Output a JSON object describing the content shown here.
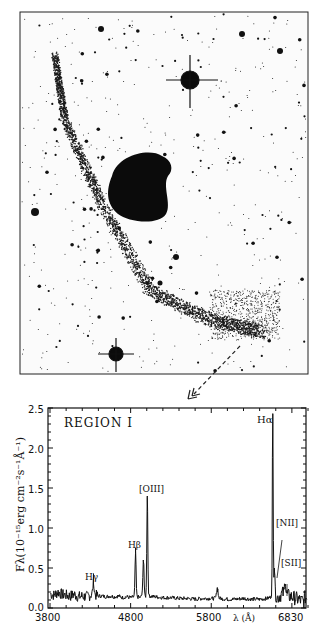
{
  "figure": {
    "image_panel": {
      "description": "Negative-print sky image of a galaxy with a curved tidal tail and bright foreground stars",
      "arrow": "dashed arrow from tail region pointing down to spectrum"
    },
    "spectrum_panel": {
      "region_label": "REGION I",
      "y_axis_label": "Fλ(10⁻¹⁵erg cm⁻²s⁻¹Å⁻¹)",
      "x_axis_label": "λ (Å)",
      "y_ticks": [
        "0.0",
        "0.5",
        "1.0",
        "1.5",
        "2.0",
        "2.5"
      ],
      "x_ticks": [
        "3800",
        "4800",
        "5800",
        "6830"
      ],
      "line_labels": {
        "hgamma": "Hγ",
        "hbeta": "Hβ",
        "oiii": "[OIII]",
        "halpha": "Hα",
        "nii": "[NII]",
        "sii": "[SII]"
      }
    }
  },
  "chart_data": {
    "type": "line",
    "title": "REGION I",
    "xlabel": "λ (Å)",
    "ylabel": "Fλ (10^-15 erg cm^-2 s^-1 Å^-1)",
    "xlim": [
      3800,
      7000
    ],
    "ylim": [
      0.0,
      2.5
    ],
    "x_ticks": [
      3800,
      4800,
      5800,
      6800
    ],
    "y_ticks": [
      0.0,
      0.5,
      1.0,
      1.5,
      2.0,
      2.5
    ],
    "grid": false,
    "continuum_level": 0.13,
    "emission_lines": [
      {
        "name": "Hγ",
        "wavelength": 4340,
        "peak": 0.3
      },
      {
        "name": "Hβ",
        "wavelength": 4861,
        "peak": 0.68
      },
      {
        "name": "[OIII]",
        "wavelength": 4959,
        "peak": 0.58
      },
      {
        "name": "[OIII]",
        "wavelength": 5007,
        "peak": 1.4
      },
      {
        "name": "HeI",
        "wavelength": 5876,
        "peak": 0.2
      },
      {
        "name": "Hα",
        "wavelength": 6563,
        "peak": 2.43
      },
      {
        "name": "[NII]",
        "wavelength": 6584,
        "peak": 0.45
      },
      {
        "name": "[SII]",
        "wavelength": 6717,
        "peak": 0.3
      }
    ],
    "series": [
      {
        "name": "Region I spectrum",
        "x": [
          3800,
          3850,
          3900,
          3950,
          4000,
          4050,
          4100,
          4150,
          4200,
          4250,
          4300,
          4340,
          4380,
          4450,
          4500,
          4550,
          4600,
          4650,
          4700,
          4750,
          4800,
          4840,
          4861,
          4880,
          4920,
          4959,
          4985,
          5007,
          5030,
          5100,
          5200,
          5300,
          5400,
          5500,
          5600,
          5700,
          5800,
          5850,
          5876,
          5900,
          6000,
          6100,
          6200,
          6300,
          6400,
          6500,
          6540,
          6563,
          6584,
          6620,
          6680,
          6717,
          6760,
          6800,
          6850,
          6900,
          6950
        ],
        "y": [
          0.18,
          0.16,
          0.2,
          0.17,
          0.16,
          0.15,
          0.17,
          0.14,
          0.15,
          0.14,
          0.16,
          0.3,
          0.15,
          0.15,
          0.14,
          0.15,
          0.14,
          0.15,
          0.13,
          0.14,
          0.13,
          0.14,
          0.68,
          0.14,
          0.13,
          0.58,
          0.14,
          1.4,
          0.15,
          0.14,
          0.13,
          0.13,
          0.12,
          0.12,
          0.11,
          0.12,
          0.12,
          0.12,
          0.2,
          0.12,
          0.11,
          0.11,
          0.12,
          0.11,
          0.11,
          0.12,
          0.14,
          2.43,
          0.45,
          0.13,
          0.18,
          0.3,
          0.15,
          0.14,
          0.12,
          0.1,
          0.08
        ]
      }
    ]
  }
}
